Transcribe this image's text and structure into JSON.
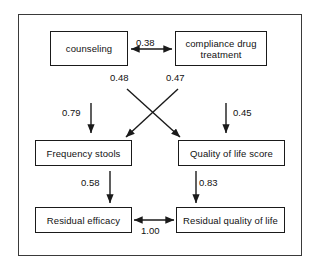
{
  "diagram": {
    "frame": {
      "name": "outer-frame"
    },
    "nodes": [
      {
        "id": "counseling",
        "label": "counseling"
      },
      {
        "id": "compliance",
        "label": "compliance drug treatment"
      },
      {
        "id": "frequency",
        "label": "Frequency stools"
      },
      {
        "id": "quality",
        "label": "Quality of life score"
      },
      {
        "id": "residual_efficacy",
        "label": "Residual efficacy"
      },
      {
        "id": "residual_quality",
        "label": "Residual quality of life"
      }
    ],
    "edges": [
      {
        "id": "e-counseling-compliance",
        "from": "counseling",
        "to": "compliance",
        "value": "0.38",
        "kind": "bidirectional"
      },
      {
        "id": "e-counseling-quality",
        "from": "counseling",
        "to": "quality",
        "value": "0.48",
        "kind": "directed"
      },
      {
        "id": "e-compliance-frequency",
        "from": "compliance",
        "to": "frequency",
        "value": "0.47",
        "kind": "directed"
      },
      {
        "id": "e-error-frequency",
        "from": "error",
        "to": "frequency",
        "value": "0.79",
        "kind": "directed"
      },
      {
        "id": "e-error-quality",
        "from": "error",
        "to": "quality",
        "value": "0.45",
        "kind": "directed"
      },
      {
        "id": "e-frequency-residual-efficacy",
        "from": "frequency",
        "to": "residual_efficacy",
        "value": "0.58",
        "kind": "directed"
      },
      {
        "id": "e-quality-residual-quality",
        "from": "quality",
        "to": "residual_quality",
        "value": "0.83",
        "kind": "directed"
      },
      {
        "id": "e-residuals",
        "from": "residual_efficacy",
        "to": "residual_quality",
        "value": "1.00",
        "kind": "bidirectional"
      }
    ],
    "colors": {
      "stroke": "#1a1a1a",
      "frame": "#3a3a3a",
      "background": "#ffffff",
      "text": "#111111"
    }
  }
}
